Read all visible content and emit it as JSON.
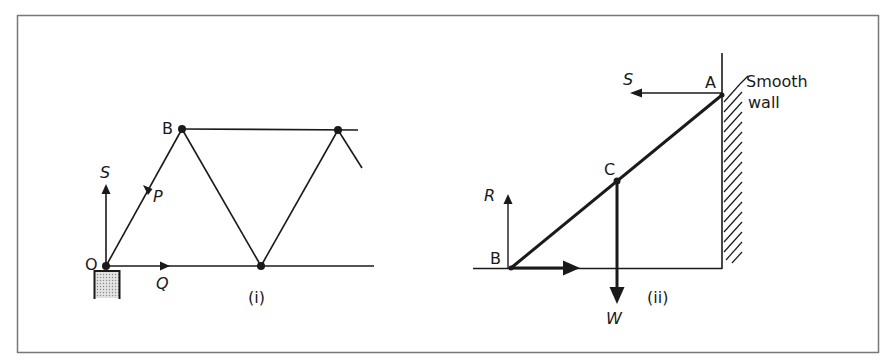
{
  "figure": {
    "frame_color": "#777777",
    "ink_color": "#1a1a1a",
    "support_fill": "#d0d0d0"
  },
  "diagram_i": {
    "caption": "(i)",
    "points": {
      "O": "O",
      "B": "B"
    },
    "forces": {
      "S": "S",
      "P": "P",
      "Q": "Q"
    }
  },
  "diagram_ii": {
    "caption": "(ii)",
    "points": {
      "A": "A",
      "B": "B",
      "C": "C"
    },
    "forces": {
      "S": "S",
      "R": "R",
      "W": "W"
    },
    "wall_label_line1": "Smooth",
    "wall_label_line2": "wall"
  }
}
